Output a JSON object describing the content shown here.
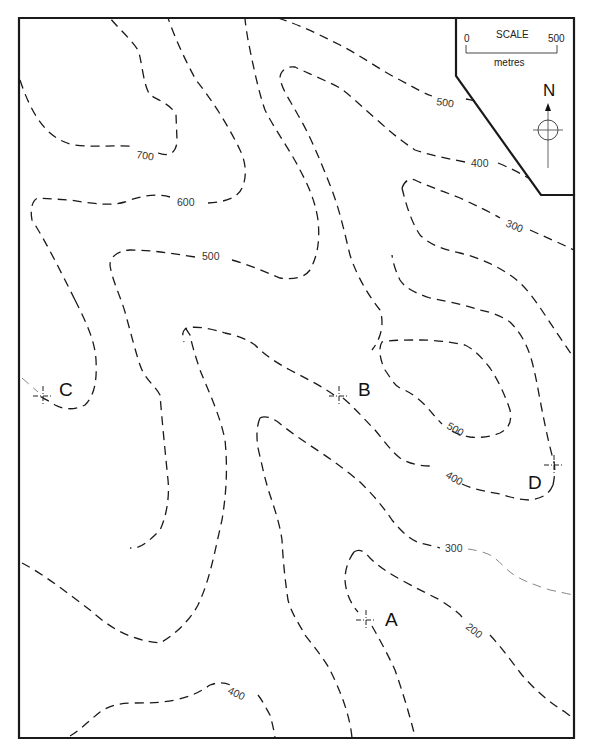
{
  "map": {
    "scale": {
      "title": "SCALE",
      "start": "0",
      "end": "500",
      "unit": "metres"
    },
    "north_arrow": {
      "label": "N"
    },
    "contours": [
      {
        "value": "700",
        "label": "700"
      },
      {
        "value": "600",
        "label": "600"
      },
      {
        "value": "500",
        "label": "500"
      },
      {
        "value": "500",
        "label": "500",
        "position": "top-right"
      },
      {
        "value": "400",
        "label": "400",
        "position": "top-right"
      },
      {
        "value": "300",
        "label": "300",
        "position": "right"
      },
      {
        "value": "500",
        "label": "500",
        "position": "near-D"
      },
      {
        "value": "400",
        "label": "400",
        "position": "near-D"
      },
      {
        "value": "300",
        "label": "300",
        "position": "near-A"
      },
      {
        "value": "200",
        "label": "200",
        "position": "near-A"
      },
      {
        "value": "400",
        "label": "400",
        "position": "bottom"
      }
    ],
    "points": [
      {
        "id": "A",
        "label": "A"
      },
      {
        "id": "B",
        "label": "B"
      },
      {
        "id": "C",
        "label": "C"
      },
      {
        "id": "D",
        "label": "D"
      }
    ]
  }
}
